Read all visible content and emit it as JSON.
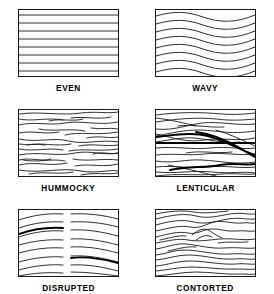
{
  "figure": {
    "background_color": "#ffffff",
    "line_color": "#1a1a1a",
    "bold_line_color": "#000000",
    "columns": 2,
    "rows": 3
  },
  "panels": [
    {
      "id": "even",
      "label": "EVEN",
      "row": 1,
      "column": 1,
      "description": "Straight parallel horizontal laminae spanning the full width",
      "line_count": 8,
      "lines": [
        "M0,5 L99,5",
        "M0,13 L99,13",
        "M0,21 L99,21",
        "M0,29 L99,29",
        "M0,37 L99,37",
        "M0,45 L99,45",
        "M0,53 L99,53",
        "M0,61 L99,61"
      ],
      "bold_lines": []
    },
    {
      "id": "wavy",
      "label": "WAVY",
      "row": 1,
      "column": 2,
      "description": "Continuous smooth sinusoidal laminae, uniform wavelength, lines remain parallel",
      "line_count": 8,
      "lines": [
        "M0,6 C18,1 30,1 47,7 C64,13 80,13 99,5",
        "M0,14 C18,9 30,9 47,15 C64,21 80,21 99,13",
        "M0,22 C18,17 30,17 47,23 C64,29 80,29 99,21",
        "M0,30 C18,25 30,25 47,31 C64,37 80,37 99,29",
        "M0,38 C18,33 30,33 47,39 C64,45 80,45 99,37",
        "M0,46 C18,41 30,41 47,47 C64,53 80,53 99,45",
        "M0,54 C18,49 30,49 47,55 C64,61 80,61 99,53",
        "M0,62 C18,57 30,57 47,63 C64,69 80,69 99,61"
      ],
      "bold_lines": []
    },
    {
      "id": "hummocky",
      "label": "HUMMOCKY",
      "row": 2,
      "column": 1,
      "description": "Numerous short discontinuous low-angle undulating segments, irregular and overlapping",
      "line_count": 26,
      "lines": [
        "M0,4 C20,1 42,6 62,3 C78,1 88,4 99,2",
        "M0,9 C14,12 28,7 44,10",
        "M52,8 C66,6 78,10 92,7",
        "M0,15 C16,11 30,16 46,13 C62,10 78,16 99,12",
        "M20,19 C34,22 50,18 66,21",
        "M72,18 C82,20 90,17 99,19",
        "M0,23 C14,20 26,25 40,22",
        "M46,25 C62,21 76,26 99,22",
        "M0,29 C18,33 34,27 50,31 C66,35 82,29 99,32",
        "M8,35 C22,32 36,37 52,34",
        "M60,36 C74,33 86,37 99,35",
        "M0,39 C16,42 30,37 44,40",
        "M50,41 C64,38 80,42 99,39",
        "M0,45 C20,41 38,47 56,43 C72,40 86,46 99,43",
        "M4,50 C18,53 32,48 46,51",
        "M54,49 C68,52 84,48 99,50",
        "M0,55 C16,51 32,57 48,53",
        "M56,56 C70,53 84,58 99,54",
        "M0,60 C22,64 42,57 62,61 C78,64 90,59 99,61",
        "M10,64 C26,61 40,65 54,62",
        "M62,65 C76,62 88,65 99,63",
        "M0,50 C12,47 22,52 32,49",
        "M68,28 C80,25 90,29 99,27",
        "M0,34 C10,36 18,33 26,35",
        "M30,11 C42,8 54,12 64,9",
        "M74,44 C84,41 92,45 99,43"
      ],
      "bold_lines": []
    },
    {
      "id": "lenticular",
      "label": "LENTICULAR",
      "row": 2,
      "column": 2,
      "description": "Lens-shaped bodies formed by converging and crossing laminae; several heavy bounding lines",
      "line_count": 18,
      "lines": [
        "M0,5 C22,2 44,2 66,4 C80,5 90,4 99,3",
        "M0,12 C20,9 40,7 60,9 C76,11 88,10 99,9",
        "M0,19 C18,21 30,15 46,13 C64,11 80,16 99,14",
        "M0,26 C16,23 28,20 42,20 C60,20 72,25 99,21",
        "M0,24 C18,28 32,33 48,30 C66,27 82,32 99,28",
        "M0,32 C14,30 26,27 38,28 C58,30 74,35 99,33",
        "M0,38 C20,36 36,40 54,38 C72,36 86,40 99,38",
        "M0,45 C18,43 32,46 48,44 C66,42 84,46 99,44",
        "M0,51 C16,54 30,49 46,50 C64,51 80,55 99,52",
        "M0,57 C18,55 34,59 52,57 C70,55 86,59 99,57",
        "M0,62 C20,64 38,60 56,62 C74,64 88,61 99,63",
        "M22,16 C38,14 52,18 68,17",
        "M30,43 C46,40 60,44 76,42",
        "M0,8 C16,10 28,13 40,16",
        "M60,20 C74,24 86,30 99,36",
        "M12,55 C28,58 44,62 60,66",
        "M44,33 C58,31 70,34 84,32",
        "M0,66 C22,63 44,66 66,64 C80,63 90,65 99,64"
      ],
      "bold_lines": [
        "M0,33 L99,33",
        "M0,27 C20,25 36,22 52,26 C70,31 84,40 99,45",
        "M14,60 C32,56 48,58 64,55 C80,52 90,56 99,54",
        "M40,22 C56,24 70,30 84,38 C90,42 95,45 99,47"
      ]
    },
    {
      "id": "disrupted",
      "label": "DISRUPTED",
      "row": 3,
      "column": 1,
      "description": "Laminae arched and truncated by a vertical break near the centre; segments offset across the discontinuity",
      "line_count": 16,
      "lines": [
        "M0,10 C14,5 30,3 44,4",
        "M52,4 C68,3 84,5 99,9",
        "M0,18 C14,13 30,11 44,12",
        "M52,12 C68,11 84,13 99,17",
        "M0,27 C14,22 30,20 44,21",
        "M52,20 C68,19 84,22 99,26",
        "M0,35 C14,31 30,29 44,30",
        "M52,29 C68,28 84,31 99,35",
        "M0,43 C14,39 30,37 44,38",
        "M52,37 C68,36 84,39 99,43",
        "M0,52 C14,48 30,46 44,47",
        "M52,46 C68,45 84,48 99,52",
        "M0,60 C14,56 30,54 44,55",
        "M52,55 C68,54 84,57 99,61",
        "M0,66 C14,63 30,62 44,63",
        "M52,62 C68,62 84,64 99,66"
      ],
      "bold_lines": [
        "M0,24 C14,19 30,17 44,18",
        "M52,48 C68,46 84,49 99,53"
      ]
    },
    {
      "id": "contorted",
      "label": "CONTORTED",
      "row": 3,
      "column": 2,
      "description": "Strongly folded and convoluted laminae forming rounded and chevron-like crests",
      "line_count": 17,
      "lines": [
        "M0,9 C16,5 28,3 40,6 C52,9 62,6 74,4 C86,2 92,5 99,4",
        "M0,15 C14,11 26,9 38,12 C50,15 60,11 72,9 C84,7 92,10 99,9",
        "M0,21 C14,18 24,15 34,17 C44,19 50,14 58,12 C68,10 76,14 86,13 C92,12 96,14 99,13",
        "M0,27 C12,24 22,21 32,23 C40,25 46,20 54,19 C62,18 70,22 80,21 C88,20 94,22 99,21",
        "M36,25 C42,20 48,17 54,21 C58,24 62,26 66,28",
        "M40,30 C46,26 50,24 56,27",
        "M0,33 C12,31 22,28 32,30 C42,32 52,30 64,29 C78,28 88,31 99,29",
        "M0,39 C12,37 20,33 30,34 C42,35 54,39 68,38 C82,37 92,39 99,38",
        "M0,45 C10,44 18,40 28,40 C44,40 58,45 74,44 C86,43 94,45 99,44",
        "M0,50 C12,49 20,45 32,45 C48,45 62,50 78,49 C88,48 94,50 99,49",
        "M0,56 C12,55 20,51 34,51 C50,51 64,55 80,54 C90,53 95,55 99,54",
        "M0,61 C12,60 22,57 36,57 C52,57 66,60 82,59 C90,59 95,60 99,59",
        "M0,66 C14,65 26,62 40,62 C56,62 70,65 86,64 C92,64 96,65 99,64",
        "M0,4 C14,1 26,0 38,2 C50,4 60,2 72,1",
        "M4,30 C14,28 22,25 30,26",
        "M62,33 C72,31 82,33 92,32",
        "M12,41 C22,39 30,36 40,37"
      ],
      "bold_lines": []
    }
  ]
}
